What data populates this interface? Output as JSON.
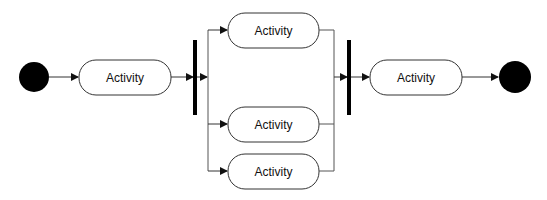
{
  "diagram": {
    "type": "uml-activity",
    "initial_node": {
      "label": ""
    },
    "activities": [
      {
        "id": "a1",
        "label": "Activity"
      },
      {
        "id": "a2",
        "label": "Activity"
      },
      {
        "id": "a3",
        "label": "Activity"
      },
      {
        "id": "a4",
        "label": "Activity"
      },
      {
        "id": "a5",
        "label": "Activity"
      }
    ],
    "fork_bar": {
      "label": ""
    },
    "join_bar": {
      "label": ""
    },
    "final_node": {
      "label": ""
    },
    "colors": {
      "stroke": "#333333",
      "node_fill": "#000000",
      "box_fill": "#ffffff"
    }
  }
}
